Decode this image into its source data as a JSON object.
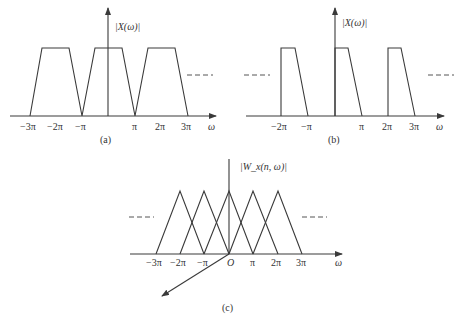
{
  "panels": {
    "a": {
      "caption": "(a)",
      "y_label": "|X(ω)|",
      "x_label": "ω",
      "ticks": [
        "−3π",
        "−2π",
        "−π",
        "π",
        "2π",
        "3π"
      ]
    },
    "b": {
      "caption": "(b)",
      "y_label": "|X(ω)|",
      "x_label": "ω",
      "ticks": [
        "−2π",
        "−π",
        "π",
        "2π",
        "3π"
      ]
    },
    "c": {
      "caption": "(c)",
      "y_label": "|W_x(n, ω)|",
      "x_label": "ω",
      "origin": "O",
      "ticks": [
        "−3π",
        "−2π",
        "−π",
        "π",
        "2π",
        "3π"
      ]
    }
  }
}
